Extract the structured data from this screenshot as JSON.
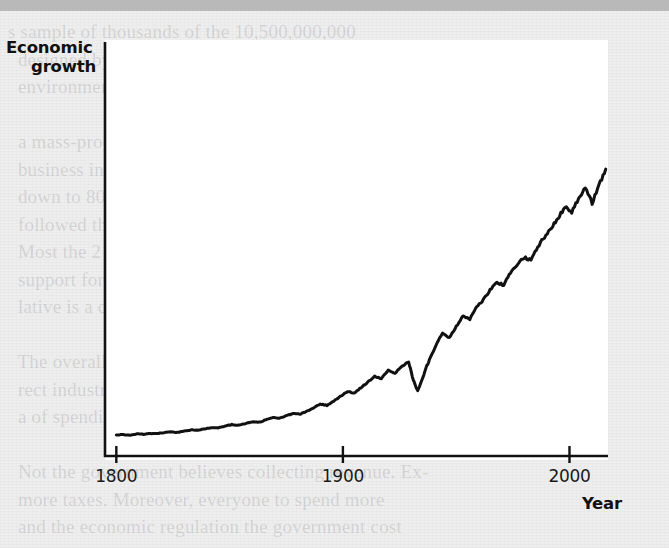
{
  "figure": {
    "background_color": "#eeeeee",
    "panel_color": "#ffffff",
    "top_bar_color": "#b9b9b9",
    "ink_color": "#111111"
  },
  "labels": {
    "y_axis_line1": "Economic",
    "y_axis_line2": "growth",
    "x_axis_title": "Year"
  },
  "ghost_text": "s sample of thousands of the 10,500,000,000\n  designed by a group of doctors, lawyers, and\n  environmentalists.\n\n  a mass-production of  a well-tailored individual legal\n  business industry.              a taxes: revenue is millions\n  down to 80 percent that people should buy out\n  followed the tax cuts, they pretend still had not bring out\n  Most the 2 debates, experts have raised about sig-\n  support for new worldwide resources can be used for a deficit\n  lative is a contradictly possible.\n\n  The overall approaching an evidence noted by the indi-\n  rect industries revenue with how it of its government in\n  a of spending.\n\n  Not the government believes collecting revenue. Ex-\n  more taxes. Moreover, everyone to spend more\n  and the economic regulation the government cost",
  "chart_data": {
    "type": "line",
    "title": "",
    "xlabel": "Year",
    "ylabel": "Economic growth",
    "xlim": [
      1795,
      2017
    ],
    "ylim": [
      0,
      100
    ],
    "xticks": [
      1800,
      1900,
      2000
    ],
    "xtick_labels": [
      "1800",
      "1900",
      "2000"
    ],
    "yticks": [],
    "ytick_labels": [],
    "grid": false,
    "legend": null,
    "series": [
      {
        "name": "Economic growth",
        "color": "#111111",
        "line_width": 3,
        "x": [
          1800,
          1803,
          1806,
          1809,
          1812,
          1815,
          1818,
          1821,
          1824,
          1827,
          1830,
          1833,
          1836,
          1839,
          1842,
          1845,
          1848,
          1851,
          1854,
          1857,
          1860,
          1863,
          1866,
          1869,
          1872,
          1875,
          1878,
          1881,
          1884,
          1887,
          1890,
          1893,
          1896,
          1899,
          1902,
          1905,
          1908,
          1911,
          1914,
          1917,
          1920,
          1923,
          1926,
          1929,
          1931,
          1933,
          1935,
          1937,
          1939,
          1941,
          1944,
          1947,
          1950,
          1953,
          1956,
          1959,
          1962,
          1965,
          1968,
          1971,
          1974,
          1977,
          1980,
          1983,
          1986,
          1989,
          1992,
          1995,
          1998,
          2001,
          2004,
          2007,
          2010,
          2013,
          2016
        ],
        "y": [
          3.0,
          3.2,
          3.0,
          3.4,
          3.3,
          3.6,
          3.5,
          3.9,
          4.1,
          4.0,
          4.4,
          4.8,
          4.7,
          5.2,
          5.6,
          5.5,
          6.1,
          6.6,
          6.4,
          7.0,
          7.6,
          7.4,
          8.2,
          8.9,
          8.7,
          9.6,
          10.4,
          10.2,
          11.2,
          12.2,
          13.6,
          13.2,
          14.6,
          16.2,
          17.8,
          17.4,
          19.2,
          21.0,
          23.0,
          22.2,
          25.0,
          24.0,
          26.4,
          28.0,
          22.0,
          18.0,
          22.0,
          26.5,
          30.0,
          33.5,
          38.0,
          36.0,
          40.0,
          43.5,
          42.5,
          46.5,
          49.0,
          52.5,
          55.0,
          54.0,
          58.5,
          61.0,
          63.5,
          62.5,
          67.0,
          70.5,
          73.5,
          77.0,
          80.5,
          79.0,
          83.5,
          87.5,
          82.0,
          88.0,
          93.5
        ]
      }
    ],
    "annotations": [
      {
        "label": "Great Depression dip",
        "x": 1933,
        "y": 18.0
      }
    ]
  }
}
